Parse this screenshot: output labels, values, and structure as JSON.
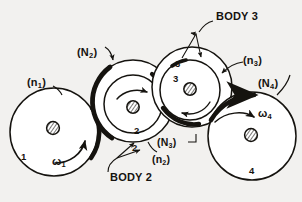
{
  "figure": {
    "style": "hand-drawn engineering sketch",
    "background_color": "#f2f1ef",
    "ink_color": "#15130f"
  },
  "labels": {
    "body3": "BODY 3",
    "body2": "BODY 2",
    "n1": "(n",
    "n1_sub": "1",
    "n1_close": ")",
    "N2": "(N",
    "N2_sub": "2",
    "N2_close": ")",
    "n3": "(n",
    "n3_sub": "3",
    "n3_close": ")",
    "N4": "(N",
    "N4_sub": "4",
    "N4_close": ")",
    "N3": "(N",
    "N3_sub": "3",
    "N3_close": ")",
    "n2": "(n",
    "n2_sub": "2",
    "n2_close": ")",
    "omega1": "ω",
    "omega1_sub": "1",
    "omega4": "ω",
    "omega4_sub": "4"
  },
  "body_numbers": {
    "one": "1",
    "two_outer": "2",
    "two_inner": "2",
    "three_outer": "3",
    "three_inner": "3",
    "four": "4"
  },
  "bodies": [
    {
      "id": "1",
      "name": "gear-1",
      "cx": 54,
      "cy": 132,
      "r_outer": 44,
      "hub": true,
      "label": "1",
      "omega": "ω₁"
    },
    {
      "id": "2",
      "name": "gear-2",
      "cx": 133,
      "cy": 101,
      "r_outer": 41,
      "r_inner": 29,
      "hub": true,
      "label": "2"
    },
    {
      "id": "3",
      "name": "gear-3",
      "cx": 192,
      "cy": 87,
      "r_outer": 40,
      "r_inner": 30,
      "hub": true,
      "label": "3"
    },
    {
      "id": "4",
      "name": "gear-4",
      "cx": 252,
      "cy": 136,
      "r_outer": 44,
      "hub": true,
      "label": "4",
      "omega": "ω₄"
    }
  ],
  "annotations": {
    "contact_arcs": 4,
    "rotation_arrows": [
      "omega-1-ccw",
      "gear-2-arc",
      "gear-3-arc",
      "omega-4-cw"
    ],
    "leader_lines": 7
  }
}
